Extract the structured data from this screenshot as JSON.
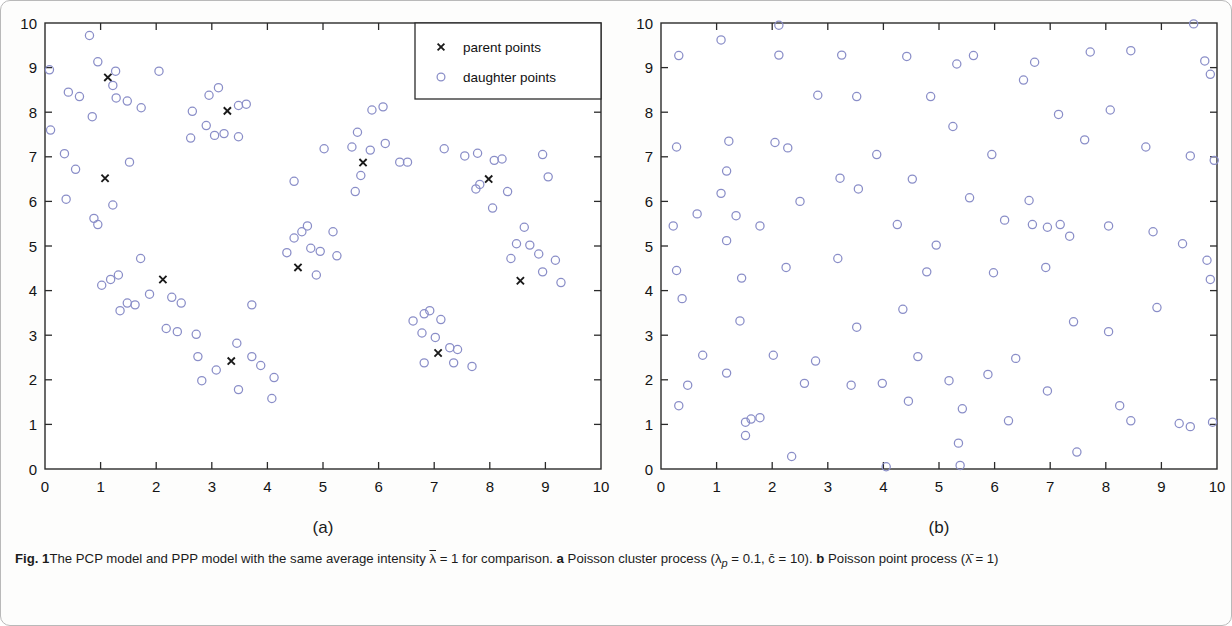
{
  "figure": {
    "label": "Fig. 1",
    "caption_part1": "The PCP model and PPP model with the same average intensity ",
    "caption_lambda_bar": "λ",
    "caption_part2": " = 1 for comparison. ",
    "caption_a_marker": "a",
    "caption_a_text": " Poisson cluster process (λ",
    "caption_a_sub": "p",
    "caption_a_text2": " = 0.1, c̄ = 10). ",
    "caption_b_marker": "b",
    "caption_b_text": " Poisson point process (λ̄ = 1)",
    "caption_full": "Fig. 1 The PCP model and PPP model with the same average intensity λ̄ = 1 for comparison. a Poisson cluster process (λp = 0.1, c̄ = 10). b Poisson point process (λ̄ = 1)"
  },
  "panel_a": {
    "letter": "(a)",
    "legend": {
      "parent_label": "parent points",
      "daughter_label": "daughter points",
      "parent_marker": "cross-marker",
      "daughter_marker": "circle-marker"
    }
  },
  "panel_b": {
    "letter": "(b)"
  },
  "style": {
    "marker_color": "#8a8ec8",
    "parent_color": "#1a1a1a",
    "axis_color": "#2b2b2b"
  },
  "chart_data": [
    {
      "type": "scatter",
      "panel": "a",
      "title": "Poisson cluster process",
      "xlabel": "",
      "ylabel": "",
      "xlim": [
        0,
        10
      ],
      "ylim": [
        0,
        10
      ],
      "xticks": [
        0,
        1,
        2,
        3,
        4,
        5,
        6,
        7,
        8,
        9,
        10
      ],
      "yticks": [
        0,
        1,
        2,
        3,
        4,
        5,
        6,
        7,
        8,
        9,
        10
      ],
      "grid": false,
      "legend_position": "top-right",
      "series": [
        {
          "name": "parent points",
          "marker": "x",
          "color": "#1a1a1a",
          "points": [
            [
              1.13,
              8.78
            ],
            [
              1.08,
              6.52
            ],
            [
              3.28,
              8.03
            ],
            [
              2.12,
              4.25
            ],
            [
              3.35,
              2.42
            ],
            [
              4.55,
              4.52
            ],
            [
              5.72,
              6.87
            ],
            [
              7.07,
              2.6
            ],
            [
              7.98,
              6.5
            ],
            [
              8.55,
              4.22
            ]
          ]
        },
        {
          "name": "daughter points",
          "marker": "o",
          "color": "#8a8ec8",
          "points": [
            [
              0.8,
              9.72
            ],
            [
              0.95,
              9.13
            ],
            [
              1.27,
              8.92
            ],
            [
              1.22,
              8.6
            ],
            [
              0.08,
              8.95
            ],
            [
              0.42,
              8.45
            ],
            [
              0.62,
              8.35
            ],
            [
              1.28,
              8.32
            ],
            [
              1.48,
              8.25
            ],
            [
              0.85,
              7.9
            ],
            [
              0.1,
              7.6
            ],
            [
              0.35,
              7.07
            ],
            [
              1.73,
              8.1
            ],
            [
              2.05,
              8.92
            ],
            [
              2.95,
              8.38
            ],
            [
              3.12,
              8.55
            ],
            [
              3.62,
              8.18
            ],
            [
              3.48,
              8.15
            ],
            [
              2.65,
              8.02
            ],
            [
              3.22,
              7.52
            ],
            [
              2.62,
              7.42
            ],
            [
              3.05,
              7.48
            ],
            [
              3.48,
              7.45
            ],
            [
              2.9,
              7.7
            ],
            [
              1.52,
              6.88
            ],
            [
              0.38,
              6.05
            ],
            [
              0.55,
              6.72
            ],
            [
              0.88,
              5.62
            ],
            [
              0.95,
              5.48
            ],
            [
              1.22,
              5.92
            ],
            [
              1.18,
              4.25
            ],
            [
              1.32,
              4.35
            ],
            [
              1.02,
              4.12
            ],
            [
              1.48,
              3.72
            ],
            [
              1.62,
              3.68
            ],
            [
              1.35,
              3.55
            ],
            [
              1.88,
              3.92
            ],
            [
              1.72,
              4.72
            ],
            [
              2.28,
              3.85
            ],
            [
              2.45,
              3.72
            ],
            [
              2.18,
              3.15
            ],
            [
              2.38,
              3.08
            ],
            [
              2.72,
              3.02
            ],
            [
              2.75,
              2.52
            ],
            [
              2.82,
              1.98
            ],
            [
              3.08,
              2.22
            ],
            [
              3.48,
              1.78
            ],
            [
              3.72,
              2.52
            ],
            [
              3.88,
              2.32
            ],
            [
              4.08,
              1.58
            ],
            [
              4.12,
              2.05
            ],
            [
              3.72,
              3.68
            ],
            [
              3.45,
              2.82
            ],
            [
              4.62,
              5.32
            ],
            [
              4.72,
              5.45
            ],
            [
              4.48,
              5.18
            ],
            [
              4.78,
              4.95
            ],
            [
              4.95,
              4.88
            ],
            [
              4.35,
              4.85
            ],
            [
              4.88,
              4.35
            ],
            [
              5.18,
              5.32
            ],
            [
              5.25,
              4.78
            ],
            [
              5.02,
              7.18
            ],
            [
              5.62,
              7.55
            ],
            [
              5.52,
              7.22
            ],
            [
              5.88,
              8.05
            ],
            [
              6.08,
              8.12
            ],
            [
              6.12,
              7.3
            ],
            [
              5.85,
              7.15
            ],
            [
              6.38,
              6.88
            ],
            [
              6.52,
              6.88
            ],
            [
              5.68,
              6.58
            ],
            [
              5.58,
              6.22
            ],
            [
              6.82,
              3.48
            ],
            [
              6.92,
              3.55
            ],
            [
              6.62,
              3.32
            ],
            [
              7.12,
              3.35
            ],
            [
              6.78,
              3.05
            ],
            [
              7.02,
              2.95
            ],
            [
              7.28,
              2.72
            ],
            [
              7.42,
              2.68
            ],
            [
              6.82,
              2.38
            ],
            [
              7.35,
              2.38
            ],
            [
              7.68,
              2.3
            ],
            [
              7.18,
              7.18
            ],
            [
              7.55,
              7.02
            ],
            [
              7.78,
              7.08
            ],
            [
              8.08,
              6.92
            ],
            [
              8.22,
              6.95
            ],
            [
              7.82,
              6.38
            ],
            [
              7.75,
              6.28
            ],
            [
              8.32,
              6.22
            ],
            [
              8.05,
              5.85
            ],
            [
              8.62,
              5.42
            ],
            [
              8.48,
              5.05
            ],
            [
              8.72,
              5.02
            ],
            [
              8.38,
              4.72
            ],
            [
              8.88,
              4.82
            ],
            [
              8.95,
              4.42
            ],
            [
              9.18,
              4.68
            ],
            [
              9.28,
              4.18
            ],
            [
              9.05,
              6.55
            ],
            [
              8.95,
              7.05
            ],
            [
              4.48,
              6.45
            ]
          ]
        }
      ]
    },
    {
      "type": "scatter",
      "panel": "b",
      "title": "Poisson point process",
      "xlabel": "",
      "ylabel": "",
      "xlim": [
        0,
        10
      ],
      "ylim": [
        0,
        10
      ],
      "xticks": [
        0,
        1,
        2,
        3,
        4,
        5,
        6,
        7,
        8,
        9,
        10
      ],
      "yticks": [
        0,
        1,
        2,
        3,
        4,
        5,
        6,
        7,
        8,
        9,
        10
      ],
      "grid": false,
      "legend_position": "none",
      "series": [
        {
          "name": "points",
          "marker": "o",
          "color": "#8a8ec8",
          "points": [
            [
              0.32,
              9.27
            ],
            [
              1.08,
              9.62
            ],
            [
              2.12,
              9.95
            ],
            [
              2.12,
              9.28
            ],
            [
              3.25,
              9.28
            ],
            [
              4.42,
              9.25
            ],
            [
              5.32,
              9.08
            ],
            [
              5.62,
              9.27
            ],
            [
              2.82,
              8.38
            ],
            [
              3.52,
              8.35
            ],
            [
              7.72,
              9.35
            ],
            [
              8.45,
              9.38
            ],
            [
              9.58,
              9.98
            ],
            [
              9.78,
              9.15
            ],
            [
              9.88,
              8.85
            ],
            [
              0.28,
              7.22
            ],
            [
              1.22,
              7.35
            ],
            [
              2.05,
              7.32
            ],
            [
              2.28,
              7.2
            ],
            [
              1.18,
              6.68
            ],
            [
              1.08,
              6.18
            ],
            [
              0.22,
              5.45
            ],
            [
              0.65,
              5.72
            ],
            [
              1.35,
              5.68
            ],
            [
              1.18,
              5.12
            ],
            [
              1.78,
              5.45
            ],
            [
              3.22,
              6.52
            ],
            [
              3.55,
              6.28
            ],
            [
              4.52,
              6.5
            ],
            [
              4.85,
              8.35
            ],
            [
              5.25,
              7.68
            ],
            [
              5.95,
              7.05
            ],
            [
              6.52,
              8.72
            ],
            [
              6.72,
              9.12
            ],
            [
              7.15,
              7.95
            ],
            [
              7.62,
              7.38
            ],
            [
              8.08,
              8.05
            ],
            [
              8.72,
              7.22
            ],
            [
              9.52,
              7.02
            ],
            [
              9.95,
              6.92
            ],
            [
              2.5,
              6.0
            ],
            [
              4.25,
              5.48
            ],
            [
              5.55,
              6.08
            ],
            [
              6.18,
              5.58
            ],
            [
              6.68,
              5.48
            ],
            [
              6.95,
              5.42
            ],
            [
              7.18,
              5.48
            ],
            [
              7.35,
              5.22
            ],
            [
              8.05,
              5.45
            ],
            [
              8.85,
              5.32
            ],
            [
              9.38,
              5.05
            ],
            [
              9.82,
              4.68
            ],
            [
              9.88,
              4.25
            ],
            [
              0.38,
              3.82
            ],
            [
              0.28,
              4.45
            ],
            [
              1.42,
              3.32
            ],
            [
              2.25,
              4.52
            ],
            [
              3.18,
              4.72
            ],
            [
              3.52,
              3.18
            ],
            [
              4.95,
              5.02
            ],
            [
              4.78,
              4.42
            ],
            [
              5.98,
              4.4
            ],
            [
              6.92,
              4.52
            ],
            [
              7.42,
              3.3
            ],
            [
              8.92,
              3.62
            ],
            [
              8.05,
              3.08
            ],
            [
              1.18,
              2.15
            ],
            [
              2.35,
              0.28
            ],
            [
              1.52,
              1.05
            ],
            [
              1.62,
              1.12
            ],
            [
              1.78,
              1.15
            ],
            [
              1.52,
              0.75
            ],
            [
              0.32,
              1.42
            ],
            [
              0.48,
              1.88
            ],
            [
              2.58,
              1.92
            ],
            [
              3.42,
              1.88
            ],
            [
              3.98,
              1.92
            ],
            [
              4.05,
              0.05
            ],
            [
              4.45,
              1.52
            ],
            [
              5.18,
              1.98
            ],
            [
              5.38,
              0.08
            ],
            [
              5.42,
              1.35
            ],
            [
              5.35,
              0.58
            ],
            [
              6.25,
              1.08
            ],
            [
              6.95,
              1.75
            ],
            [
              7.48,
              0.38
            ],
            [
              8.25,
              1.42
            ],
            [
              8.45,
              1.08
            ],
            [
              9.32,
              1.02
            ],
            [
              9.52,
              0.95
            ],
            [
              9.92,
              1.05
            ],
            [
              2.02,
              2.55
            ],
            [
              4.62,
              2.52
            ],
            [
              5.88,
              2.12
            ],
            [
              6.38,
              2.48
            ],
            [
              0.75,
              2.55
            ],
            [
              4.35,
              3.58
            ],
            [
              1.45,
              4.28
            ],
            [
              2.78,
              2.42
            ],
            [
              6.62,
              6.02
            ],
            [
              3.88,
              7.05
            ]
          ]
        }
      ]
    }
  ]
}
